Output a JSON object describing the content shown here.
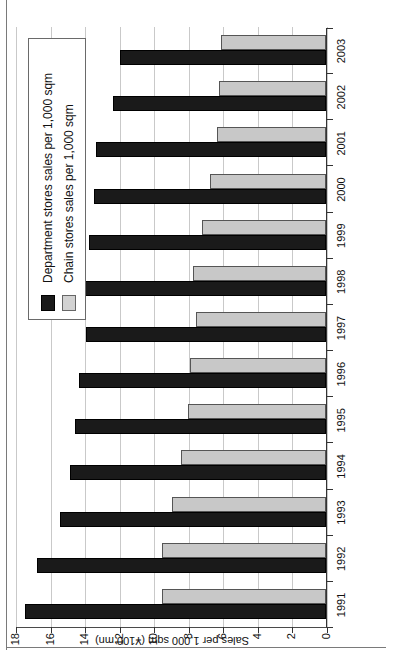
{
  "chart_data": {
    "type": "bar",
    "title": "",
    "subtitle": "",
    "orientation": "vertical",
    "rotated_in_screenshot": true,
    "xlabel": "",
    "ylabel": "Sales per 1,000 sqm (¥100 mn)",
    "ylim": [
      0,
      18
    ],
    "ytick_values": [
      0,
      2,
      4,
      6,
      8,
      10,
      12,
      14,
      16,
      18
    ],
    "ytick_labels": [
      "0",
      "2",
      "4",
      "6",
      "8",
      "10",
      "12",
      "14",
      "16",
      "18"
    ],
    "grid": true,
    "grid_axis": "y",
    "legend_position": "upper-right",
    "categories": [
      "1991",
      "1992",
      "1993",
      "1994",
      "1995",
      "1996",
      "1997",
      "1998",
      "1999",
      "2000",
      "2001",
      "2002",
      "2003"
    ],
    "series": [
      {
        "name": "Department stores sales per 1,000 sqm",
        "color": "#1a1a1a",
        "values": [
          17.4,
          16.7,
          15.4,
          14.8,
          14.5,
          14.3,
          13.9,
          14.2,
          13.7,
          13.4,
          13.3,
          12.3,
          11.9
        ]
      },
      {
        "name": "Chain stores sales per 1,000 sqm",
        "color": "#c8c8c8",
        "values": [
          9.5,
          9.5,
          8.9,
          8.4,
          8.0,
          7.9,
          7.5,
          7.7,
          7.2,
          6.7,
          6.3,
          6.2,
          6.1
        ]
      }
    ]
  },
  "legend": {
    "items": [
      {
        "label": "Department stores sales per 1,000 sqm",
        "swatch": "dept"
      },
      {
        "label": "Chain stores sales per 1,000 sqm",
        "swatch": "chain"
      }
    ]
  },
  "axes": {
    "y_title": "Sales per 1,000 sqm (¥100 mn)"
  }
}
